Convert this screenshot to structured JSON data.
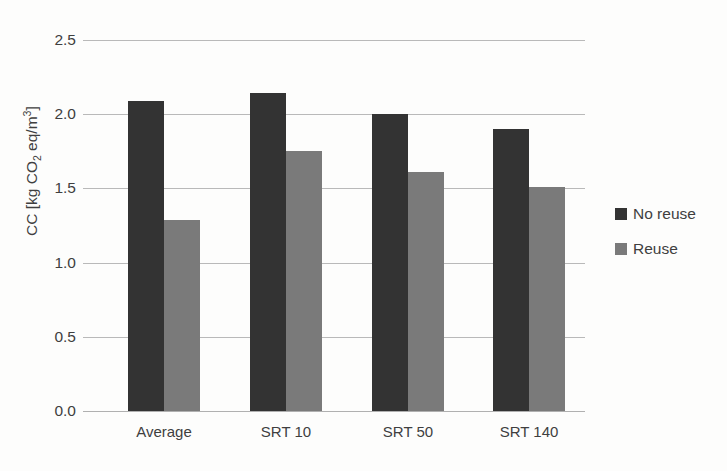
{
  "chart_data": {
    "type": "bar",
    "title": "",
    "xlabel": "",
    "ylabel": "CC [kg CO2 eq/m3]",
    "ylabel_parts": {
      "prefix": "CC [kg CO",
      "sub": "2",
      "mid": " eq/m",
      "sup": "3",
      "suffix": "]"
    },
    "categories": [
      "Average",
      "SRT 10",
      "SRT 50",
      "SRT 140"
    ],
    "series": [
      {
        "name": "No reuse",
        "color": "#333333",
        "values": [
          2.09,
          2.14,
          2.0,
          1.9
        ]
      },
      {
        "name": "Reuse",
        "color": "#7a7a7a",
        "values": [
          1.29,
          1.75,
          1.61,
          1.51
        ]
      }
    ],
    "ylim": [
      0.0,
      2.5
    ],
    "yticks": [
      0.0,
      0.5,
      1.0,
      1.5,
      2.0,
      2.5
    ],
    "ytick_labels": [
      "0.0",
      "0.5",
      "1.0",
      "1.5",
      "2.0",
      "2.5"
    ],
    "grid": true,
    "legend_position": "right",
    "colors": {
      "background": "#fdfdfc",
      "gridline": "#b9b9b9",
      "text": "#3f3f3f"
    }
  }
}
